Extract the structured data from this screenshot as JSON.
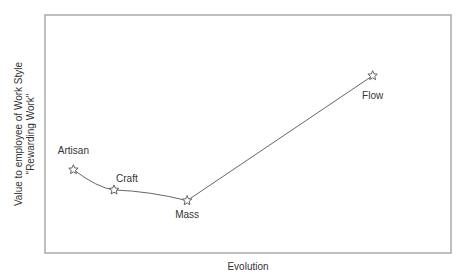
{
  "chart_data": {
    "type": "line",
    "title": "",
    "xlabel": "Evolution",
    "ylabel_lines": [
      "Value to employee of Work Style",
      "\"Rewarding Work\""
    ],
    "grid": false,
    "legend": null,
    "points": [
      {
        "label": "Artisan",
        "x": 0.07,
        "y": 0.35
      },
      {
        "label": "Craft",
        "x": 0.17,
        "y": 0.265
      },
      {
        "label": "Mass",
        "x": 0.35,
        "y": 0.22
      },
      {
        "label": "Flow",
        "x": 0.807,
        "y": 0.745
      }
    ],
    "xlim": [
      0,
      1
    ],
    "ylim": [
      0,
      1
    ],
    "marker": "star",
    "line_color": "#555555"
  }
}
